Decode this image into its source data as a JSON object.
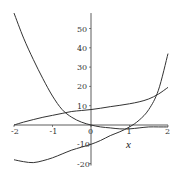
{
  "chart_data": {
    "type": "line",
    "title": "",
    "xlabel": "x",
    "ylabel": "",
    "xlim": [
      -2,
      2
    ],
    "ylim": [
      -20,
      58
    ],
    "grid": false,
    "legend": null,
    "x_ticks": [
      "-2",
      "-1",
      "0",
      "1",
      "2"
    ],
    "y_ticks": [
      "-20",
      "-10",
      "10",
      "20",
      "30",
      "40",
      "50"
    ],
    "x": [
      -2,
      -1.75,
      -1.5,
      -1.25,
      -1,
      -0.75,
      -0.5,
      -0.25,
      0,
      0.25,
      0.5,
      0.75,
      1,
      1.25,
      1.5,
      1.75,
      2
    ],
    "series": [
      {
        "name": "decaying curve",
        "values": [
          58,
          45,
          34,
          24,
          15,
          8,
          4,
          1.5,
          0,
          -1,
          -1.5,
          -2,
          -2,
          -1.5,
          -1,
          -1,
          -1
        ]
      },
      {
        "name": "rising curve",
        "values": [
          0,
          1.5,
          2.8,
          4,
          5,
          6,
          7,
          7.5,
          8,
          8.7,
          9.5,
          10.2,
          11,
          12,
          13.5,
          16,
          19.5
        ]
      },
      {
        "name": "cubic curve",
        "values": [
          -18,
          -19,
          -19.5,
          -18.5,
          -17,
          -15,
          -13,
          -11.5,
          -10,
          -8,
          -5.5,
          -3.5,
          -1,
          2.5,
          8,
          18,
          37
        ]
      }
    ]
  }
}
